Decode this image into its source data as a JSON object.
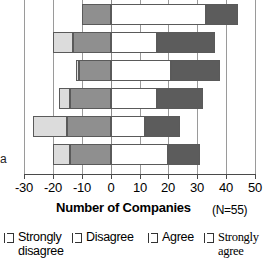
{
  "chart_data": {
    "type": "bar",
    "orientation": "horizontal",
    "stacked": true,
    "diverging": true,
    "title": "",
    "xlabel": "Number of Companies",
    "ylabel": "",
    "note": "(N=55)",
    "xlim": [
      -30,
      50
    ],
    "xticks": [
      -30,
      -20,
      -10,
      0,
      10,
      20,
      30,
      40,
      50
    ],
    "xticklabels": [
      "-30",
      "-20",
      "-10",
      "0",
      "10",
      "20",
      "30",
      "40",
      "50"
    ],
    "grid": true,
    "legend_position": "bottom",
    "categories": [
      "item-1",
      "item-2",
      "item-3",
      "item-4",
      "item-5",
      "item-6"
    ],
    "series": [
      {
        "name": "Strongly disagree",
        "color": "#dcdcdc",
        "values": [
          0,
          -7,
          -1,
          -4,
          -12,
          -6
        ]
      },
      {
        "name": "Disagree",
        "color": "#8f8f8f",
        "values": [
          -10,
          -13,
          -11,
          -14,
          -15,
          -14
        ]
      },
      {
        "name": "Agree",
        "color": "#ffffff",
        "values": [
          33,
          16,
          21,
          16,
          12,
          20
        ]
      },
      {
        "name": "Strongly agree",
        "color": "#5c5c5c",
        "values": [
          11,
          20,
          17,
          16,
          12,
          11
        ]
      }
    ],
    "bar_segments": [
      {
        "row": 0,
        "strongly_disagree": [
          0,
          0
        ],
        "disagree": [
          -10,
          0
        ],
        "agree": [
          0,
          33
        ],
        "strongly_agree": [
          33,
          44
        ]
      },
      {
        "row": 1,
        "strongly_disagree": [
          -20,
          -13
        ],
        "disagree": [
          -13,
          0
        ],
        "agree": [
          0,
          16
        ],
        "strongly_agree": [
          16,
          36
        ]
      },
      {
        "row": 2,
        "strongly_disagree": [
          -12,
          -11
        ],
        "disagree": [
          -11,
          0
        ],
        "agree": [
          0,
          21
        ],
        "strongly_agree": [
          21,
          38
        ]
      },
      {
        "row": 3,
        "strongly_disagree": [
          -18,
          -14
        ],
        "disagree": [
          -14,
          0
        ],
        "agree": [
          0,
          16
        ],
        "strongly_agree": [
          16,
          32
        ]
      },
      {
        "row": 4,
        "strongly_disagree": [
          -27,
          -15
        ],
        "disagree": [
          -15,
          0
        ],
        "agree": [
          0,
          12
        ],
        "strongly_agree": [
          12,
          24
        ]
      },
      {
        "row": 5,
        "strongly_disagree": [
          -20,
          -14
        ],
        "disagree": [
          -14,
          0
        ],
        "agree": [
          0,
          20
        ],
        "strongly_agree": [
          20,
          31
        ]
      }
    ]
  },
  "axis": {
    "title": "Number of Companies",
    "note": "(N=55)",
    "ticks": [
      "-30",
      "-20",
      "-10",
      "0",
      "10",
      "20",
      "30",
      "40",
      "50"
    ],
    "clipped_category_label": "a"
  },
  "legend": {
    "items": [
      {
        "label": "Strongly\ndisagree",
        "color": "#dcdcdc"
      },
      {
        "label": "Disagree",
        "color": "#8f8f8f"
      },
      {
        "label": "Agree",
        "color": "#ffffff"
      },
      {
        "label": "Strongly\nagree",
        "color": "#5c5c5c"
      }
    ]
  },
  "colors": {
    "strongly_disagree": "#dcdcdc",
    "disagree": "#8f8f8f",
    "agree": "#ffffff",
    "strongly_agree": "#5c5c5c",
    "grid": "#9a9a9a",
    "axis": "#4a4a4a",
    "text": "#000000",
    "background": "#ffffff"
  }
}
